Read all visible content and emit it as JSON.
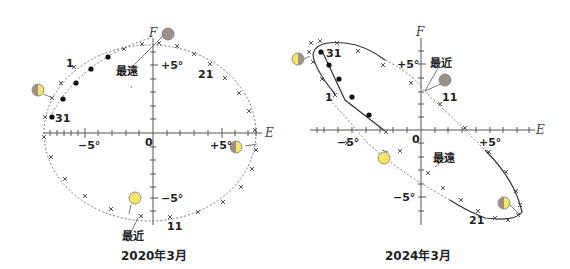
{
  "diagrams": [
    {
      "caption": "2020年3月",
      "axes": {
        "x_label": "E",
        "y_label": "F",
        "origin": "0",
        "x_ticks": [
          "−5°",
          "+5°"
        ],
        "y_ticks": [
          "+5°",
          "−5°"
        ]
      },
      "annotations": {
        "farthest": "最遠",
        "nearest": "最近"
      },
      "date_labels": [
        "1",
        "21",
        "31",
        "11"
      ]
    },
    {
      "caption": "2024年3月",
      "axes": {
        "x_label": "E",
        "y_label": "F",
        "origin": "0",
        "x_ticks": [
          "−5°",
          "+5°"
        ],
        "y_ticks": [
          "+5°",
          "−5°"
        ]
      },
      "annotations": {
        "farthest": "最遠",
        "nearest": "最近"
      },
      "date_labels": [
        "31",
        "1",
        "11",
        "21"
      ]
    }
  ],
  "colors": {
    "moon_bright": "#f5e46a",
    "moon_dark": "#9e9087",
    "line": "#555555"
  }
}
